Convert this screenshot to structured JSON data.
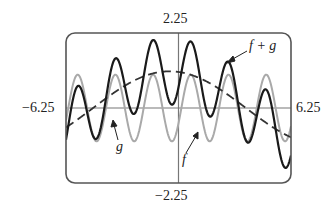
{
  "chart_data": {
    "type": "line",
    "title": "",
    "xlabel": "",
    "ylabel": "",
    "xlim": [
      -6.25,
      6.25
    ],
    "ylim": [
      -2.25,
      2.25
    ],
    "grid": false,
    "legend": "none (curves labeled by arrows)",
    "tick_labels": {
      "x_min": "−6.25",
      "x_max": "6.25",
      "y_max": "2.25",
      "y_min": "−2.25"
    },
    "series": [
      {
        "name": "f",
        "style": "dashed",
        "color": "#333333",
        "formula": "1.1*cos(0.37*(x+0.5))",
        "params": {
          "amp": 1.1,
          "freq": 0.37,
          "shift": 0.5
        }
      },
      {
        "name": "g",
        "style": "solid",
        "color": "#a9a9a9",
        "formula": "cos(3*(x+5.6))",
        "params": {
          "amp": 1.0,
          "freq": 3.0,
          "shift": 5.6
        }
      },
      {
        "name": "f + g",
        "style": "solid-bold",
        "color": "#1a1a1a",
        "formula": "f(x) + g(x)"
      }
    ],
    "annotations": [
      {
        "text": "f + g",
        "target": "f + g",
        "arrow_from": [
          247,
          50
        ],
        "arrow_to": [
          228,
          62
        ]
      },
      {
        "text": "g",
        "target": "g",
        "arrow_from": [
          117,
          140
        ],
        "arrow_to": [
          113,
          122
        ]
      },
      {
        "text": "f",
        "target": "f",
        "arrow_from": [
          186,
          150
        ],
        "arrow_to": [
          197,
          133
        ]
      }
    ]
  },
  "labels": {
    "y_top": "2.25",
    "y_bottom": "−2.25",
    "x_left": "−6.25",
    "x_right": "6.25",
    "fg": "f + g",
    "g": "g",
    "f": "f"
  }
}
